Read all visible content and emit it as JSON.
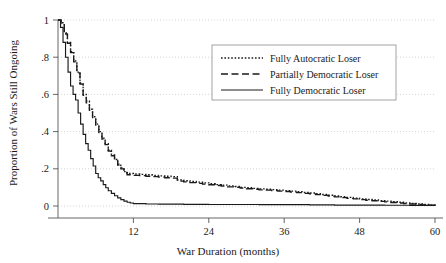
{
  "chart_data": {
    "type": "line",
    "title": "",
    "xlabel": "War Duration (months)",
    "ylabel": "Proportion of Wars Still Ongoing",
    "xlim": [
      0,
      60
    ],
    "ylim": [
      0,
      1
    ],
    "xticks": [
      0,
      12,
      24,
      36,
      48,
      60
    ],
    "xtick_labels": [
      "",
      "12",
      "24",
      "36",
      "48",
      "60"
    ],
    "yticks": [
      0,
      0.2,
      0.4,
      0.6,
      0.8,
      1
    ],
    "ytick_labels": [
      "0",
      ".2",
      ".4",
      ".6",
      ".8",
      "1"
    ],
    "grid": true,
    "grid_style": "dotted",
    "grid_color": "#c8c8c8",
    "legend_position": "upper-right",
    "series": [
      {
        "name": "Fully Autocratic Loser",
        "style": "dotted",
        "color": "#1a1a1a",
        "points": [
          [
            0,
            1.0
          ],
          [
            0.5,
            0.985
          ],
          [
            1,
            0.93
          ],
          [
            1.5,
            0.88
          ],
          [
            2,
            0.83
          ],
          [
            2.5,
            0.78
          ],
          [
            3,
            0.72
          ],
          [
            3.5,
            0.66
          ],
          [
            4,
            0.6
          ],
          [
            4.5,
            0.565
          ],
          [
            5,
            0.52
          ],
          [
            5.5,
            0.48
          ],
          [
            6,
            0.44
          ],
          [
            6.5,
            0.4
          ],
          [
            7,
            0.365
          ],
          [
            7.5,
            0.335
          ],
          [
            8,
            0.3
          ],
          [
            8.5,
            0.275
          ],
          [
            9,
            0.25
          ],
          [
            9.5,
            0.225
          ],
          [
            10,
            0.205
          ],
          [
            10.5,
            0.185
          ],
          [
            11,
            0.175
          ],
          [
            12,
            0.172
          ],
          [
            13,
            0.17
          ],
          [
            14,
            0.168
          ],
          [
            15,
            0.165
          ],
          [
            16,
            0.162
          ],
          [
            17,
            0.16
          ],
          [
            18,
            0.158
          ],
          [
            19,
            0.14
          ],
          [
            20,
            0.136
          ],
          [
            21,
            0.132
          ],
          [
            22,
            0.128
          ],
          [
            23,
            0.124
          ],
          [
            24,
            0.12
          ],
          [
            25,
            0.115
          ],
          [
            26,
            0.112
          ],
          [
            27,
            0.108
          ],
          [
            28,
            0.105
          ],
          [
            29,
            0.1
          ],
          [
            30,
            0.098
          ],
          [
            31,
            0.095
          ],
          [
            32,
            0.092
          ],
          [
            33,
            0.09
          ],
          [
            34,
            0.088
          ],
          [
            35,
            0.085
          ],
          [
            36,
            0.083
          ],
          [
            37,
            0.08
          ],
          [
            38,
            0.077
          ],
          [
            39,
            0.073
          ],
          [
            40,
            0.07
          ],
          [
            41,
            0.066
          ],
          [
            42,
            0.062
          ],
          [
            43,
            0.058
          ],
          [
            44,
            0.054
          ],
          [
            45,
            0.05
          ],
          [
            46,
            0.046
          ],
          [
            47,
            0.042
          ],
          [
            48,
            0.038
          ],
          [
            49,
            0.035
          ],
          [
            50,
            0.032
          ],
          [
            51,
            0.029
          ],
          [
            52,
            0.026
          ],
          [
            53,
            0.023
          ],
          [
            54,
            0.02
          ],
          [
            55,
            0.017
          ],
          [
            56,
            0.014
          ],
          [
            57,
            0.011
          ],
          [
            58,
            0.008
          ],
          [
            59,
            0.005
          ],
          [
            60,
            0.003
          ]
        ]
      },
      {
        "name": "Partially Democratic Loser",
        "style": "dashed",
        "color": "#1a1a1a",
        "points": [
          [
            0,
            1.0
          ],
          [
            0.5,
            0.98
          ],
          [
            1,
            0.925
          ],
          [
            1.5,
            0.875
          ],
          [
            2,
            0.825
          ],
          [
            2.5,
            0.775
          ],
          [
            3,
            0.715
          ],
          [
            3.5,
            0.655
          ],
          [
            4,
            0.595
          ],
          [
            4.5,
            0.555
          ],
          [
            5,
            0.515
          ],
          [
            5.5,
            0.475
          ],
          [
            6,
            0.435
          ],
          [
            6.5,
            0.395
          ],
          [
            7,
            0.36
          ],
          [
            7.5,
            0.33
          ],
          [
            8,
            0.295
          ],
          [
            8.5,
            0.27
          ],
          [
            9,
            0.245
          ],
          [
            9.5,
            0.22
          ],
          [
            10,
            0.2
          ],
          [
            10.5,
            0.18
          ],
          [
            11,
            0.168
          ],
          [
            12,
            0.165
          ],
          [
            13,
            0.163
          ],
          [
            14,
            0.16
          ],
          [
            15,
            0.158
          ],
          [
            16,
            0.155
          ],
          [
            17,
            0.152
          ],
          [
            18,
            0.15
          ],
          [
            19,
            0.134
          ],
          [
            20,
            0.13
          ],
          [
            21,
            0.126
          ],
          [
            22,
            0.122
          ],
          [
            23,
            0.118
          ],
          [
            24,
            0.114
          ],
          [
            25,
            0.11
          ],
          [
            26,
            0.107
          ],
          [
            27,
            0.103
          ],
          [
            28,
            0.1
          ],
          [
            29,
            0.096
          ],
          [
            30,
            0.093
          ],
          [
            31,
            0.09
          ],
          [
            32,
            0.087
          ],
          [
            33,
            0.085
          ],
          [
            34,
            0.083
          ],
          [
            35,
            0.08
          ],
          [
            36,
            0.078
          ],
          [
            37,
            0.075
          ],
          [
            38,
            0.072
          ],
          [
            39,
            0.068
          ],
          [
            40,
            0.065
          ],
          [
            41,
            0.061
          ],
          [
            42,
            0.057
          ],
          [
            43,
            0.053
          ],
          [
            44,
            0.049
          ],
          [
            45,
            0.045
          ],
          [
            46,
            0.041
          ],
          [
            47,
            0.038
          ],
          [
            48,
            0.034
          ],
          [
            49,
            0.031
          ],
          [
            50,
            0.028
          ],
          [
            51,
            0.025
          ],
          [
            52,
            0.022
          ],
          [
            53,
            0.019
          ],
          [
            54,
            0.016
          ],
          [
            55,
            0.013
          ],
          [
            56,
            0.011
          ],
          [
            57,
            0.008
          ],
          [
            58,
            0.006
          ],
          [
            59,
            0.004
          ],
          [
            60,
            0.002
          ]
        ]
      },
      {
        "name": "Fully Democratic Loser",
        "style": "solid",
        "color": "#1a1a1a",
        "points": [
          [
            0,
            1.0
          ],
          [
            0.4,
            0.96
          ],
          [
            0.8,
            0.88
          ],
          [
            1.2,
            0.8
          ],
          [
            1.6,
            0.72
          ],
          [
            2,
            0.645
          ],
          [
            2.4,
            0.6
          ],
          [
            2.8,
            0.57
          ],
          [
            3.2,
            0.5
          ],
          [
            3.6,
            0.44
          ],
          [
            4,
            0.385
          ],
          [
            4.4,
            0.335
          ],
          [
            4.8,
            0.3
          ],
          [
            5.2,
            0.255
          ],
          [
            5.6,
            0.215
          ],
          [
            6,
            0.175
          ],
          [
            6.4,
            0.152
          ],
          [
            6.8,
            0.135
          ],
          [
            7.2,
            0.115
          ],
          [
            7.6,
            0.098
          ],
          [
            8,
            0.082
          ],
          [
            8.5,
            0.068
          ],
          [
            9,
            0.055
          ],
          [
            9.5,
            0.044
          ],
          [
            10,
            0.034
          ],
          [
            10.5,
            0.026
          ],
          [
            11,
            0.02
          ],
          [
            11.5,
            0.016
          ],
          [
            12,
            0.013
          ],
          [
            14,
            0.011
          ],
          [
            16,
            0.01
          ],
          [
            20,
            0.009
          ],
          [
            24,
            0.008
          ],
          [
            28,
            0.008
          ],
          [
            32,
            0.007
          ],
          [
            36,
            0.007
          ],
          [
            40,
            0.006
          ],
          [
            44,
            0.005
          ],
          [
            48,
            0.005
          ],
          [
            52,
            0.004
          ],
          [
            56,
            0.003
          ],
          [
            60,
            0.002
          ]
        ]
      }
    ]
  },
  "legend": {
    "entries": [
      {
        "label": "Fully Autocratic Loser"
      },
      {
        "label": "Partially Democratic Loser"
      },
      {
        "label": "Fully Democratic Loser"
      }
    ]
  }
}
